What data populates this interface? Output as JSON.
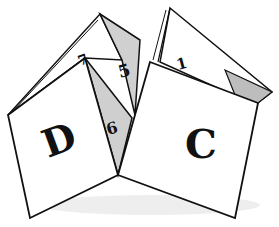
{
  "illustration": {
    "subject": "paper fortune teller",
    "letters": {
      "left": "D",
      "right": "C"
    },
    "numbers": {
      "top_left": "7",
      "top_middle": "5",
      "middle": "6",
      "top_right": "1"
    },
    "colors": {
      "paper": "#ffffff",
      "fold_shade": "#c8c8c8",
      "outline": "#111111"
    }
  }
}
